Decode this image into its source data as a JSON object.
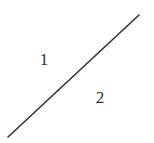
{
  "diagram": {
    "line": {
      "x1": 8,
      "y1": 137,
      "x2": 139,
      "y2": 15,
      "color": "#333333",
      "width": 1.6
    },
    "labels": [
      {
        "text": "1",
        "x": 44,
        "y": 65
      },
      {
        "text": "2",
        "x": 100,
        "y": 103
      }
    ]
  }
}
